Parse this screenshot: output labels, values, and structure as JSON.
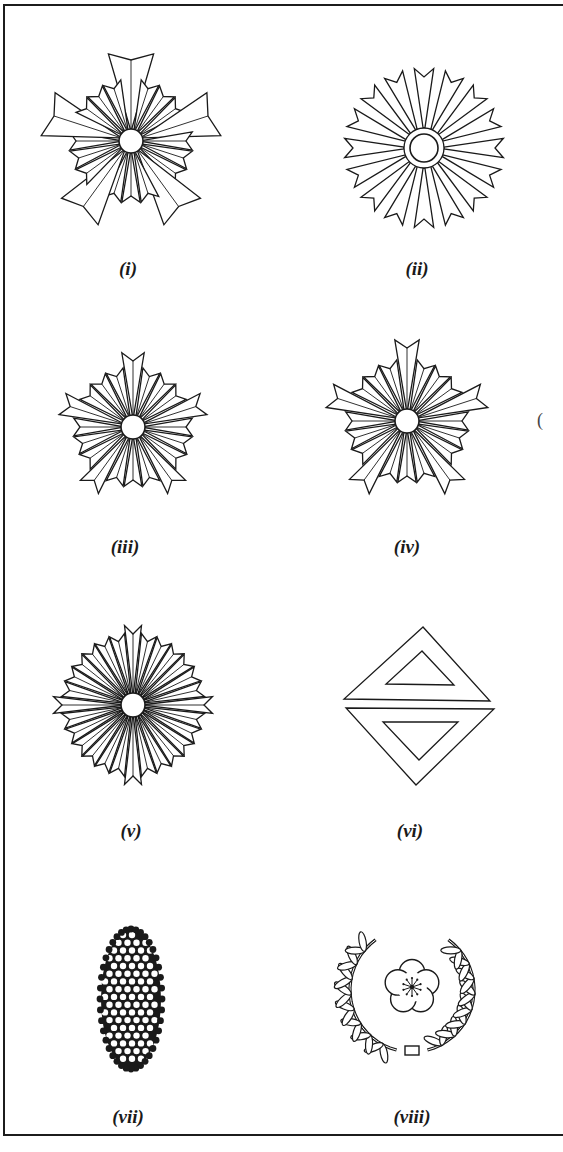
{
  "figure": {
    "colors": {
      "ink": "#1a1a1a",
      "paper": "#ffffff",
      "frame": "#1c1c1c"
    },
    "stray_mark": "(",
    "panels": [
      {
        "id": "i",
        "label": "(i)",
        "label_pos": [
          128,
          258
        ],
        "kind": "star",
        "shape": {
          "cx": 131,
          "cy": 141,
          "rays": 20,
          "long_every": 4,
          "long_r": 90,
          "short_r": 62,
          "hub_r": 12,
          "ring": false,
          "rotation": 0,
          "style": "overlap"
        }
      },
      {
        "id": "ii",
        "label": "(ii)",
        "label_pos": [
          417,
          258
        ],
        "kind": "star",
        "shape": {
          "cx": 424,
          "cy": 148,
          "rays": 16,
          "long_every": 1,
          "long_r": 80,
          "short_r": 80,
          "hub_r": 14,
          "ring": true,
          "ring_r": 20,
          "rotation": 0,
          "style": "separated"
        }
      },
      {
        "id": "iii",
        "label": "(iii)",
        "label_pos": [
          125,
          536
        ],
        "kind": "star",
        "shape": {
          "cx": 133,
          "cy": 427,
          "rays": 20,
          "long_every": 4,
          "long_r": 75,
          "short_r": 60,
          "hub_r": 12,
          "ring": false,
          "rotation": 0,
          "style": "fan"
        }
      },
      {
        "id": "iv",
        "label": "(iv)",
        "label_pos": [
          407,
          536
        ],
        "kind": "star",
        "shape": {
          "cx": 407,
          "cy": 421,
          "rays": 20,
          "long_every": 4,
          "long_r": 82,
          "short_r": 62,
          "hub_r": 12,
          "ring": false,
          "rotation": 0,
          "style": "fan"
        }
      },
      {
        "id": "v",
        "label": "(v)",
        "label_pos": [
          131,
          820
        ],
        "kind": "star",
        "shape": {
          "cx": 133,
          "cy": 705,
          "rays": 28,
          "long_every": 7,
          "long_r": 80,
          "short_r": 72,
          "hub_r": 12,
          "ring": false,
          "rotation": 0,
          "style": "fan"
        }
      },
      {
        "id": "vi",
        "label": "(vi)",
        "label_pos": [
          410,
          820
        ],
        "kind": "diamond",
        "shape": {
          "upper_outer": [
            [
              423,
              627
            ],
            [
              344,
              699
            ],
            [
              490,
              701
            ]
          ],
          "upper_inner": [
            [
              422,
              651
            ],
            [
              386,
              684
            ],
            [
              454,
              685
            ]
          ],
          "lower_outer": [
            [
              346,
              708
            ],
            [
              494,
              709
            ],
            [
              416,
              785
            ]
          ],
          "lower_inner": [
            [
              383,
              722
            ],
            [
              458,
              722
            ],
            [
              419,
              760
            ]
          ]
        }
      },
      {
        "id": "vii",
        "label": "(vii)",
        "label_pos": [
          128,
          1106
        ],
        "kind": "dotted-oval",
        "shape": {
          "cx": 131,
          "cy": 999,
          "rx": 30,
          "ry": 69,
          "dot_r": 3.2,
          "spacing": 9
        }
      },
      {
        "id": "viii",
        "label": "(viii)",
        "label_pos": [
          412,
          1106
        ],
        "kind": "wreath",
        "shape": {
          "cx": 412,
          "cy": 990,
          "r": 62,
          "flower_cx": 412,
          "flower_cy": 987,
          "flower_r": 27,
          "petals": 5,
          "leaves_per_side": 8
        }
      }
    ]
  }
}
